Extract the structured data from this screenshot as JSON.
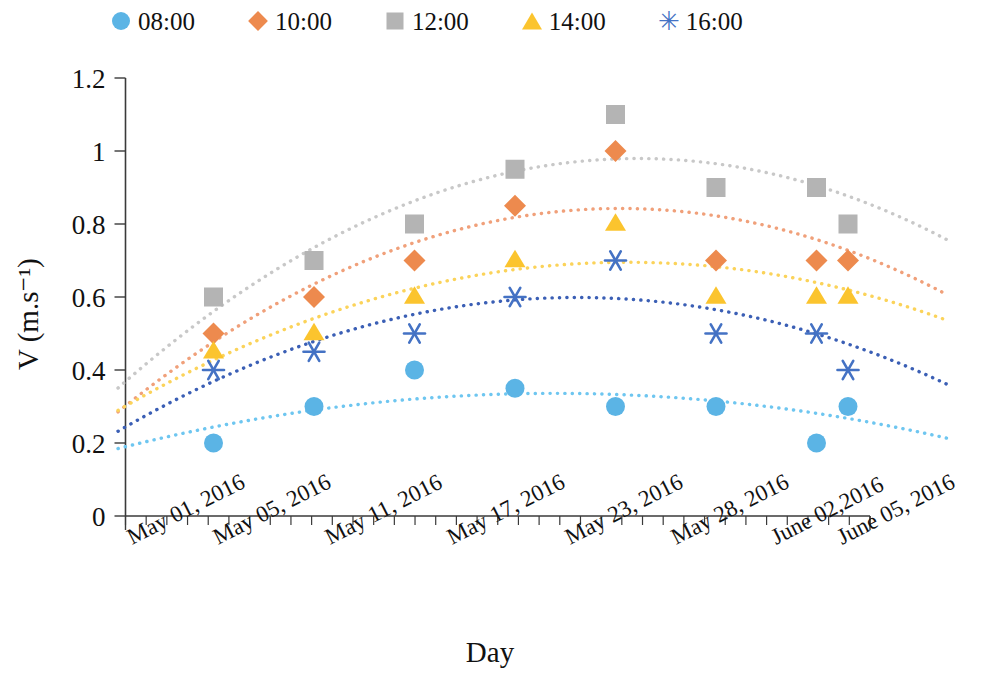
{
  "chart_data": {
    "type": "scatter",
    "title": "",
    "xlabel": "Day",
    "ylabel": "V (m.s⁻¹)",
    "ylim": [
      0,
      1.2
    ],
    "yticks": [
      "0",
      "0.2",
      "0.4",
      "0.6",
      "0.8",
      "1",
      "1.2"
    ],
    "ytick_values": [
      0,
      0.2,
      0.4,
      0.6,
      0.8,
      1,
      1.2
    ],
    "grid": false,
    "legend_position": "top",
    "categories": [
      "May 01, 2016",
      "May 05, 2016",
      "May 11, 2016",
      "May 17, 2016",
      "May 23, 2016",
      "May 28, 2016",
      "June 02,2016",
      "June 05, 2016"
    ],
    "series": [
      {
        "name": "08:00",
        "color": "#5BB4E5",
        "marker": "circle",
        "trend_color": "#6EC6F0",
        "values": [
          0.2,
          0.3,
          0.4,
          0.35,
          0.3,
          0.3,
          0.2,
          0.3
        ]
      },
      {
        "name": "10:00",
        "color": "#ED8A4E",
        "marker": "diamond",
        "trend_color": "#F0A07A",
        "values": [
          0.5,
          0.6,
          0.7,
          0.85,
          1.0,
          0.7,
          0.7,
          0.7
        ]
      },
      {
        "name": "12:00",
        "color": "#B4B4B4",
        "marker": "square",
        "trend_color": "#C8C8C8",
        "values": [
          0.6,
          0.7,
          0.8,
          0.95,
          1.1,
          0.9,
          0.9,
          0.8
        ]
      },
      {
        "name": "14:00",
        "color": "#FBC42E",
        "marker": "triangle",
        "trend_color": "#FBD35A",
        "values": [
          0.45,
          0.5,
          0.6,
          0.7,
          0.8,
          0.6,
          0.6,
          0.6
        ]
      },
      {
        "name": "16:00",
        "color": "#4472C4",
        "marker": "asterisk",
        "trend_color": "#3B5FB5",
        "values": [
          0.4,
          0.45,
          0.5,
          0.6,
          0.7,
          0.5,
          0.5,
          0.4
        ]
      }
    ]
  }
}
